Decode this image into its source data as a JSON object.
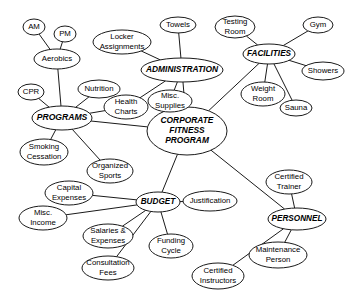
{
  "diagram": {
    "type": "concept-map",
    "style": {
      "stroke": "#1a1a1a",
      "fill": "#ffffff",
      "text": "#000000",
      "background": "#ffffff"
    },
    "nodes": [
      {
        "id": "corporate",
        "label": "CORPORATE FITNESS PROGRAM",
        "lines": [
          "CORPORATE",
          "FITNESS",
          "PROGRAM"
        ],
        "kind": "primary",
        "cx": 187,
        "cy": 131,
        "rx": 40,
        "ry": 24,
        "fontSize": 8.4
      },
      {
        "id": "programs",
        "label": "PROGRAMS",
        "lines": [
          "PROGRAMS"
        ],
        "kind": "primary",
        "cx": 62,
        "cy": 118,
        "rx": 30,
        "ry": 12,
        "fontSize": 8.6
      },
      {
        "id": "administration",
        "label": "ADMINISTRATION",
        "lines": [
          "ADMINISTRATION"
        ],
        "kind": "primary",
        "cx": 182,
        "cy": 70,
        "rx": 41,
        "ry": 12,
        "fontSize": 8.4
      },
      {
        "id": "facilities",
        "label": "FACILITIES",
        "lines": [
          "FACILITIES"
        ],
        "kind": "primary",
        "cx": 269,
        "cy": 54,
        "rx": 26,
        "ry": 10,
        "fontSize": 8.2
      },
      {
        "id": "budget",
        "label": "BUDGET",
        "lines": [
          "BUDGET"
        ],
        "kind": "primary",
        "cx": 158,
        "cy": 202,
        "rx": 22,
        "ry": 10,
        "fontSize": 8.2
      },
      {
        "id": "personnel",
        "label": "PERSONNEL",
        "lines": [
          "PERSONNEL"
        ],
        "kind": "primary",
        "cx": 297,
        "cy": 219,
        "rx": 29,
        "ry": 11,
        "fontSize": 8.2
      },
      {
        "id": "am",
        "label": "AM",
        "lines": [
          "AM"
        ],
        "kind": "leaf",
        "cx": 34,
        "cy": 27,
        "rx": 11,
        "ry": 8,
        "fontSize": 7.8
      },
      {
        "id": "pm",
        "label": "PM",
        "lines": [
          "PM"
        ],
        "kind": "leaf",
        "cx": 65,
        "cy": 34,
        "rx": 11,
        "ry": 8,
        "fontSize": 7.8
      },
      {
        "id": "aerobics",
        "label": "Aerobics",
        "lines": [
          "Aerobics"
        ],
        "kind": "leaf",
        "cx": 57,
        "cy": 59,
        "rx": 23,
        "ry": 10,
        "fontSize": 7.8
      },
      {
        "id": "cpr",
        "label": "CPR",
        "lines": [
          "CPR"
        ],
        "kind": "leaf",
        "cx": 31,
        "cy": 92,
        "rx": 13,
        "ry": 8,
        "fontSize": 7.8
      },
      {
        "id": "nutrition",
        "label": "Nutrition",
        "lines": [
          "Nutrition"
        ],
        "kind": "leaf",
        "cx": 99,
        "cy": 89,
        "rx": 21,
        "ry": 9,
        "fontSize": 7.8
      },
      {
        "id": "smoking",
        "label": "Smoking Cessation",
        "lines": [
          "Smoking",
          "Cessation"
        ],
        "kind": "leaf",
        "cx": 44,
        "cy": 152,
        "rx": 24,
        "ry": 13,
        "fontSize": 7.8
      },
      {
        "id": "organized",
        "label": "Organized Sports",
        "lines": [
          "Organized",
          "Sports"
        ],
        "kind": "leaf",
        "cx": 110,
        "cy": 171,
        "rx": 23,
        "ry": 12,
        "fontSize": 7.8
      },
      {
        "id": "locker",
        "label": "Locker Assignments",
        "lines": [
          "Locker",
          "Assignments"
        ],
        "kind": "leaf",
        "cx": 122,
        "cy": 42,
        "rx": 29,
        "ry": 12,
        "fontSize": 7.8
      },
      {
        "id": "towels",
        "label": "Towels",
        "lines": [
          "Towels"
        ],
        "kind": "leaf",
        "cx": 178,
        "cy": 25,
        "rx": 18,
        "ry": 8,
        "fontSize": 7.8
      },
      {
        "id": "health",
        "label": "Health Charts",
        "lines": [
          "Health",
          "Charts"
        ],
        "kind": "leaf",
        "cx": 126,
        "cy": 107,
        "rx": 22,
        "ry": 12,
        "fontSize": 7.8
      },
      {
        "id": "supplies",
        "label": "Misc. Supplies",
        "lines": [
          "Misc.",
          "Supplies"
        ],
        "kind": "leaf",
        "cx": 170,
        "cy": 101,
        "rx": 22,
        "ry": 11,
        "fontSize": 7.8
      },
      {
        "id": "testing",
        "label": "Testing Room",
        "lines": [
          "Testing",
          "Room"
        ],
        "kind": "leaf",
        "cx": 235,
        "cy": 27,
        "rx": 20,
        "ry": 11,
        "fontSize": 7.8
      },
      {
        "id": "gym",
        "label": "Gym",
        "lines": [
          "Gym"
        ],
        "kind": "leaf",
        "cx": 318,
        "cy": 25,
        "rx": 15,
        "ry": 8,
        "fontSize": 7.8
      },
      {
        "id": "showers",
        "label": "Showers",
        "lines": [
          "Showers"
        ],
        "kind": "leaf",
        "cx": 323,
        "cy": 71,
        "rx": 21,
        "ry": 9,
        "fontSize": 7.8
      },
      {
        "id": "weight",
        "label": "Weight Room",
        "lines": [
          "Weight",
          "Room"
        ],
        "kind": "leaf",
        "cx": 263,
        "cy": 94,
        "rx": 22,
        "ry": 12,
        "fontSize": 7.8
      },
      {
        "id": "sauna",
        "label": "Sauna",
        "lines": [
          "Sauna"
        ],
        "kind": "leaf",
        "cx": 296,
        "cy": 108,
        "rx": 16,
        "ry": 8,
        "fontSize": 7.8
      },
      {
        "id": "capital",
        "label": "Capital Expenses",
        "lines": [
          "Capital",
          "Expenses"
        ],
        "kind": "leaf",
        "cx": 69,
        "cy": 193,
        "rx": 24,
        "ry": 12,
        "fontSize": 7.8
      },
      {
        "id": "miscincome",
        "label": "Misc. Income",
        "lines": [
          "Misc.",
          "Income"
        ],
        "kind": "leaf",
        "cx": 43,
        "cy": 218,
        "rx": 24,
        "ry": 12,
        "fontSize": 7.8
      },
      {
        "id": "justification",
        "label": "Justification",
        "lines": [
          "Justification"
        ],
        "kind": "leaf",
        "cx": 210,
        "cy": 201,
        "rx": 27,
        "ry": 10,
        "fontSize": 7.8
      },
      {
        "id": "salaries",
        "label": "Salaries & Expenses",
        "lines": [
          "Salaries &",
          "Expenses"
        ],
        "kind": "leaf",
        "cx": 108,
        "cy": 236,
        "rx": 25,
        "ry": 12,
        "fontSize": 7.8
      },
      {
        "id": "consultation",
        "label": "Consultation Fees",
        "lines": [
          "Consultation",
          "Fees"
        ],
        "kind": "leaf",
        "cx": 108,
        "cy": 268,
        "rx": 26,
        "ry": 12,
        "fontSize": 7.8
      },
      {
        "id": "funding",
        "label": "Funding Cycle",
        "lines": [
          "Funding",
          "Cycle"
        ],
        "kind": "leaf",
        "cx": 171,
        "cy": 246,
        "rx": 22,
        "ry": 12,
        "fontSize": 7.8
      },
      {
        "id": "certtrainer",
        "label": "Certified Trainer",
        "lines": [
          "Certified",
          "Trainer"
        ],
        "kind": "leaf",
        "cx": 289,
        "cy": 182,
        "rx": 23,
        "ry": 12,
        "fontSize": 7.8
      },
      {
        "id": "certinstruct",
        "label": "Certified Instructors",
        "lines": [
          "Certified",
          "Instructors"
        ],
        "kind": "leaf",
        "cx": 218,
        "cy": 276,
        "rx": 26,
        "ry": 13,
        "fontSize": 7.8
      },
      {
        "id": "maintenance",
        "label": "Maintenance Person",
        "lines": [
          "Maintenance",
          "Person"
        ],
        "kind": "leaf",
        "cx": 278,
        "cy": 255,
        "rx": 29,
        "ry": 13,
        "fontSize": 7.8
      }
    ],
    "edges": [
      {
        "from": "am",
        "to": "aerobics"
      },
      {
        "from": "pm",
        "to": "aerobics"
      },
      {
        "from": "aerobics",
        "to": "programs"
      },
      {
        "from": "cpr",
        "to": "programs"
      },
      {
        "from": "nutrition",
        "to": "programs"
      },
      {
        "from": "programs",
        "to": "smoking"
      },
      {
        "from": "programs",
        "to": "organized"
      },
      {
        "from": "programs",
        "to": "corporate"
      },
      {
        "from": "locker",
        "to": "administration"
      },
      {
        "from": "towels",
        "to": "administration"
      },
      {
        "from": "administration",
        "to": "health"
      },
      {
        "from": "administration",
        "to": "supplies"
      },
      {
        "from": "administration",
        "to": "corporate"
      },
      {
        "from": "health",
        "to": "programs"
      },
      {
        "from": "testing",
        "to": "facilities"
      },
      {
        "from": "gym",
        "to": "facilities"
      },
      {
        "from": "showers",
        "to": "facilities"
      },
      {
        "from": "weight",
        "to": "facilities"
      },
      {
        "from": "sauna",
        "to": "facilities"
      },
      {
        "from": "facilities",
        "to": "corporate"
      },
      {
        "from": "corporate",
        "to": "budget"
      },
      {
        "from": "capital",
        "to": "budget"
      },
      {
        "from": "miscincome",
        "to": "budget"
      },
      {
        "from": "budget",
        "to": "justification"
      },
      {
        "from": "budget",
        "to": "salaries"
      },
      {
        "from": "budget",
        "to": "consultation"
      },
      {
        "from": "budget",
        "to": "funding"
      },
      {
        "from": "corporate",
        "to": "personnel"
      },
      {
        "from": "certtrainer",
        "to": "personnel"
      },
      {
        "from": "personnel",
        "to": "maintenance"
      },
      {
        "from": "personnel",
        "to": "certinstruct"
      }
    ]
  }
}
